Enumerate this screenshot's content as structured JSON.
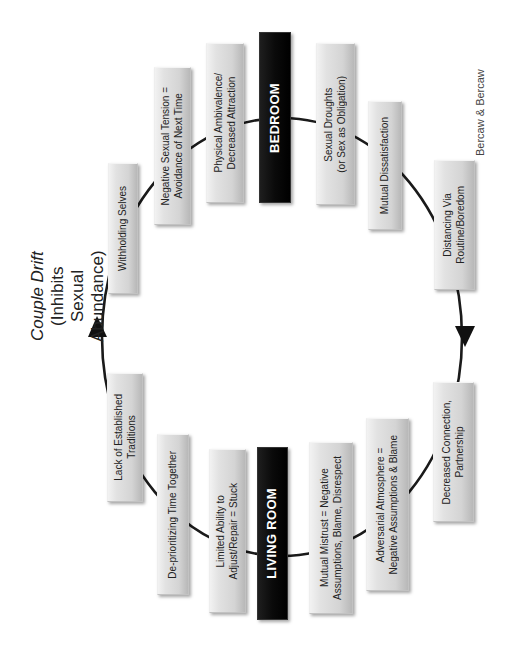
{
  "title": {
    "main": "Couple Drift",
    "sub": "(Inhibits Sexual Abundance)"
  },
  "credit": "Bercaw & Bercaw",
  "cycle": {
    "direction": "clockwise (as rendered rotated)",
    "arrows": [
      "left-side arrow pointing up",
      "right-side arrow pointing down"
    ]
  },
  "hubs": {
    "bedroom": "BEDROOM",
    "living_room": "LIVING ROOM"
  },
  "nodes": [
    {
      "id": "withholding",
      "label": "Withholding Selves"
    },
    {
      "id": "negative-tension",
      "label": "Negative Sexual Tension =\nAvoidance of Next Time"
    },
    {
      "id": "physical-ambivalence",
      "label": "Physical Ambivalence/\nDecreased Attraction"
    },
    {
      "id": "bedroom",
      "label": "BEDROOM"
    },
    {
      "id": "sexual-droughts",
      "label": "Sexual Droughts\n(or Sex as Obligation)"
    },
    {
      "id": "mutual-dissatisfaction",
      "label": "Mutual Dissatisfaction"
    },
    {
      "id": "distancing",
      "label": "Distancing Via\nRoutine/Boredom"
    },
    {
      "id": "decreased-connection",
      "label": "Decreased Connection,\nPartnership"
    },
    {
      "id": "adversarial",
      "label": "Adversarial Atmosphere =\nNegative Assumptions & Blame"
    },
    {
      "id": "mutual-mistrust",
      "label": "Mutual Mistrust = Negative\nAssumptions, Blame, Disrespect"
    },
    {
      "id": "living-room",
      "label": "LIVING ROOM"
    },
    {
      "id": "limited-ability",
      "label": "Limited Ability to\nAdjust/Repair = Stuck"
    },
    {
      "id": "deprioritizing",
      "label": "De-prioritizing Time Together"
    },
    {
      "id": "lack-traditions",
      "label": "Lack of Established\nTraditions"
    }
  ]
}
